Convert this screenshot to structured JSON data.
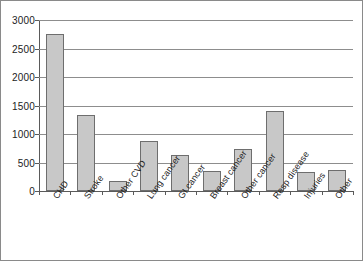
{
  "chart_data": {
    "type": "bar",
    "title": "",
    "xlabel": "",
    "ylabel": "",
    "ylim": [
      0,
      3000
    ],
    "ytick_labels": [
      "3000",
      "2500",
      "2000",
      "1500",
      "1000",
      "500",
      "0"
    ],
    "yticks": [
      3000,
      2500,
      2000,
      1500,
      1000,
      500,
      0
    ],
    "grid": true,
    "legend": false,
    "categories": [
      "CHD",
      "Stroke",
      "Other CVD",
      "Lung cancer",
      "GI cancer",
      "Breast cancer",
      "Other cancer",
      "Resp disease",
      "Injuries",
      "Other"
    ],
    "values": [
      2760,
      1340,
      175,
      880,
      625,
      350,
      740,
      1400,
      340,
      365
    ],
    "bar_fill_color": "#c8c8c8",
    "bar_border_color": "#6e6e6e",
    "gridline_color": "#8d8d8d",
    "axis_color": "#5a5a5a",
    "background_color": "#ffffff"
  }
}
